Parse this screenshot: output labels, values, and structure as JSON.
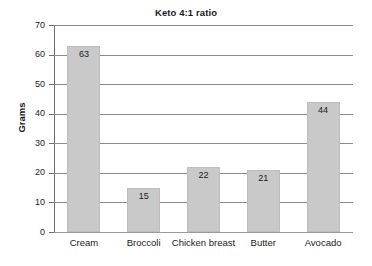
{
  "chart_data": {
    "type": "bar",
    "title": "Keto 4:1 ratio",
    "xlabel": "",
    "ylabel": "Grams",
    "categories": [
      "Cream",
      "Broccoli",
      "Chicken breast",
      "Butter",
      "Avocado"
    ],
    "values": [
      63,
      15,
      22,
      21,
      44
    ],
    "value_labels": [
      "63",
      "15",
      "22",
      "21",
      "44"
    ],
    "ylim": [
      0,
      70
    ],
    "yticks": [
      70,
      60,
      50,
      40,
      30,
      20,
      10,
      0
    ],
    "ytick_labels": [
      "70",
      "60",
      "50",
      "40",
      "30",
      "20",
      "10",
      "0"
    ],
    "grid": true,
    "legend": false,
    "series": [
      {
        "name": "Grams",
        "values": [
          63,
          15,
          22,
          21,
          44
        ]
      }
    ],
    "colors": {
      "bar_fill": "#c9c9c9",
      "bar_edge": "#bdbdbd",
      "gridline": "#8c8c8c",
      "axis": "#6e6e6e",
      "text": "#1a1a1a",
      "background": "#ffffff"
    }
  }
}
